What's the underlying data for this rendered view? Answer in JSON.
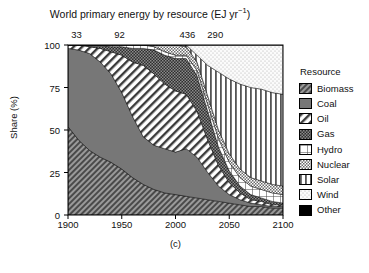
{
  "title": {
    "main": "World primary energy by resource (EJ yr",
    "exponent": "−1",
    "close": ")"
  },
  "caption": "(c)",
  "axes": {
    "ylabel": "Share (%)",
    "yticks": [
      "0",
      "25",
      "50",
      "75",
      "100"
    ],
    "ytick_values": [
      0,
      25,
      50,
      75,
      100
    ],
    "xticks": [
      "1900",
      "1950",
      "2000",
      "2050",
      "2100"
    ],
    "xtick_values": [
      1900,
      1950,
      2000,
      2050,
      2100
    ],
    "xlim": [
      1900,
      2100
    ],
    "ylim": [
      0,
      100
    ]
  },
  "top_annotations": {
    "labels": [
      "33",
      "92",
      "436",
      "290"
    ],
    "values": [
      33,
      92,
      436,
      290
    ],
    "positions_year": [
      1908,
      1948,
      2011,
      2037
    ],
    "description": "total primary energy (EJ/yr) per background shading band"
  },
  "legend": {
    "title": "Resource",
    "items": [
      {
        "label": "Biomass",
        "pattern": "dense-diagonal-hatch-dark"
      },
      {
        "label": "Coal",
        "pattern": "solid-dark-gray"
      },
      {
        "label": "Oil",
        "pattern": "wide-diagonal-hatch-light"
      },
      {
        "label": "Gas",
        "pattern": "dark-checker-dots"
      },
      {
        "label": "Hydro",
        "pattern": "grid-crosshatch"
      },
      {
        "label": "Nuclear",
        "pattern": "fine-checker-dots"
      },
      {
        "label": "Solar",
        "pattern": "vertical-lines"
      },
      {
        "label": "Wind",
        "pattern": "light-stipple"
      },
      {
        "label": "Other",
        "pattern": "solid-black"
      }
    ]
  },
  "chart_data": {
    "type": "area",
    "stacked": true,
    "title": "World primary energy by resource (EJ yr−1)",
    "xlabel": "",
    "ylabel": "Share (%)",
    "xlim": [
      1900,
      2100
    ],
    "ylim": [
      0,
      100
    ],
    "grid": false,
    "legend_position": "right",
    "x": [
      1900,
      1910,
      1920,
      1930,
      1940,
      1950,
      1960,
      1970,
      1980,
      1990,
      2000,
      2010,
      2020,
      2030,
      2040,
      2050,
      2060,
      2070,
      2080,
      2090,
      2100
    ],
    "series": [
      {
        "name": "Biomass",
        "values": [
          52,
          44,
          38,
          34,
          31,
          27,
          22,
          18,
          15,
          13,
          12,
          11,
          10,
          9,
          8,
          7,
          6,
          5,
          5,
          4,
          4
        ]
      },
      {
        "name": "Coal",
        "values": [
          46,
          53,
          57,
          56,
          52,
          45,
          36,
          28,
          26,
          26,
          25,
          28,
          24,
          16,
          9,
          5,
          3,
          2,
          1,
          1,
          1
        ]
      },
      {
        "name": "Oil",
        "values": [
          2,
          3,
          4,
          8,
          13,
          22,
          32,
          42,
          42,
          38,
          36,
          32,
          27,
          19,
          12,
          7,
          4,
          2,
          2,
          1,
          1
        ]
      },
      {
        "name": "Gas",
        "values": [
          0,
          0,
          1,
          2,
          3,
          5,
          8,
          10,
          14,
          17,
          19,
          21,
          21,
          17,
          11,
          7,
          4,
          3,
          2,
          2,
          1
        ]
      },
      {
        "name": "Hydro",
        "values": [
          0,
          0,
          0,
          0,
          1,
          1,
          2,
          2,
          2,
          2,
          2,
          2,
          3,
          4,
          5,
          5,
          5,
          5,
          5,
          5,
          5
        ]
      },
      {
        "name": "Nuclear",
        "values": [
          0,
          0,
          0,
          0,
          0,
          0,
          0,
          0,
          1,
          4,
          6,
          5,
          5,
          5,
          5,
          5,
          5,
          5,
          5,
          5,
          5
        ]
      },
      {
        "name": "Solar",
        "values": [
          0,
          0,
          0,
          0,
          0,
          0,
          0,
          0,
          0,
          0,
          0,
          1,
          4,
          18,
          34,
          44,
          50,
          53,
          54,
          54,
          54
        ]
      },
      {
        "name": "Wind",
        "values": [
          0,
          0,
          0,
          0,
          0,
          0,
          0,
          0,
          0,
          0,
          0,
          0,
          6,
          12,
          16,
          20,
          23,
          25,
          26,
          28,
          29
        ]
      },
      {
        "name": "Other",
        "values": [
          0,
          0,
          0,
          0,
          0,
          0,
          0,
          0,
          0,
          0,
          0,
          0,
          0,
          0,
          0,
          0,
          0,
          0,
          0,
          0,
          0
        ]
      }
    ],
    "background_bands": [
      {
        "label": "33",
        "x_start": 1900,
        "x_end": 1920,
        "shade": "#5e5e5e"
      },
      {
        "label": "92",
        "x_start": 1920,
        "x_end": 2010,
        "shade": "#6b6b6b"
      },
      {
        "label": "436",
        "x_start": 2010,
        "x_end": 2022,
        "shade": "#c8c8c8"
      },
      {
        "label": "290",
        "x_start": 2022,
        "x_end": 2100,
        "shade": "#e2e2e2"
      }
    ]
  }
}
